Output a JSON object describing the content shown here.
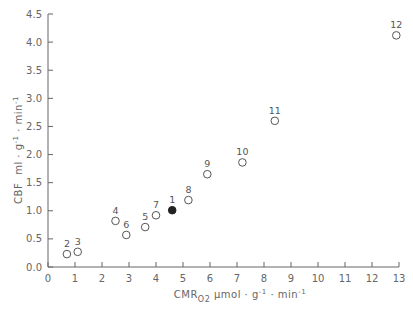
{
  "chart_data": {
    "type": "scatter",
    "title": "",
    "xlabel": "CMR O2 µmol · g⁻¹ · min⁻¹",
    "ylabel": "CBF ml · g⁻¹ · min⁻¹",
    "xlim": [
      0,
      13
    ],
    "ylim": [
      0,
      4.5
    ],
    "grid": false,
    "legend": null,
    "x_ticks": [
      "0",
      "1",
      "2",
      "3",
      "4",
      "5",
      "6",
      "7",
      "8",
      "9",
      "10",
      "11",
      "12",
      "13"
    ],
    "y_ticks": [
      "0.0",
      "0.5",
      "1.0",
      "1.5",
      "2.0",
      "2.5",
      "3.0",
      "3.5",
      "4.0",
      "4.5"
    ],
    "points": [
      {
        "label": "1",
        "x": 4.6,
        "y": 1.01,
        "filled": true
      },
      {
        "label": "2",
        "x": 0.7,
        "y": 0.23,
        "filled": false
      },
      {
        "label": "3",
        "x": 1.1,
        "y": 0.27,
        "filled": false
      },
      {
        "label": "4",
        "x": 2.5,
        "y": 0.82,
        "filled": false
      },
      {
        "label": "5",
        "x": 3.6,
        "y": 0.71,
        "filled": false
      },
      {
        "label": "6",
        "x": 2.9,
        "y": 0.57,
        "filled": false
      },
      {
        "label": "7",
        "x": 4.0,
        "y": 0.92,
        "filled": false
      },
      {
        "label": "8",
        "x": 5.2,
        "y": 1.19,
        "filled": false
      },
      {
        "label": "9",
        "x": 5.9,
        "y": 1.65,
        "filled": false
      },
      {
        "label": "10",
        "x": 7.2,
        "y": 1.86,
        "filled": false
      },
      {
        "label": "11",
        "x": 8.4,
        "y": 2.6,
        "filled": false
      },
      {
        "label": "12",
        "x": 12.9,
        "y": 4.12,
        "filled": false
      }
    ],
    "colors": {
      "axis": "#666666",
      "marker": "#555555",
      "filled_marker": "#222222"
    }
  },
  "axes": {
    "y_label_main": "CBF",
    "y_label_unit": "ml · g",
    "y_label_exp1": "-1",
    "y_label_mid": " · min",
    "y_label_exp2": "-1",
    "x_label_main": "CMR",
    "x_label_sub": "O2",
    "x_label_unit": " µmol · g",
    "x_label_exp1": "-1",
    "x_label_mid": " · min",
    "x_label_exp2": "-1"
  }
}
